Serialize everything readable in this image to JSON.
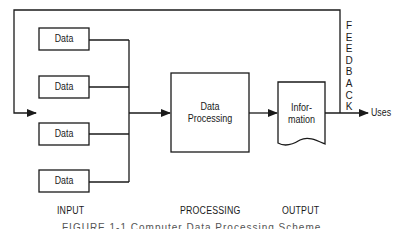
{
  "diagram": {
    "input_boxes": [
      {
        "label": "Data"
      },
      {
        "label": "Data"
      },
      {
        "label": "Data"
      },
      {
        "label": "Data"
      }
    ],
    "processing_box": {
      "line1": "Data",
      "line2": "Processing"
    },
    "output_document": {
      "line1": "Infor-",
      "line2": "mation"
    },
    "uses_label": "Uses",
    "feedback_label": [
      "F",
      "E",
      "E",
      "D",
      "B",
      "A",
      "C",
      "K"
    ],
    "stage_labels": {
      "input": "INPUT",
      "processing": "PROCESSING",
      "output": "OUTPUT"
    },
    "caption": "FIGURE 1-1  Computer Data Processing Scheme",
    "colors": {
      "line": "#1a1a1a",
      "background": "#ffffff"
    }
  }
}
